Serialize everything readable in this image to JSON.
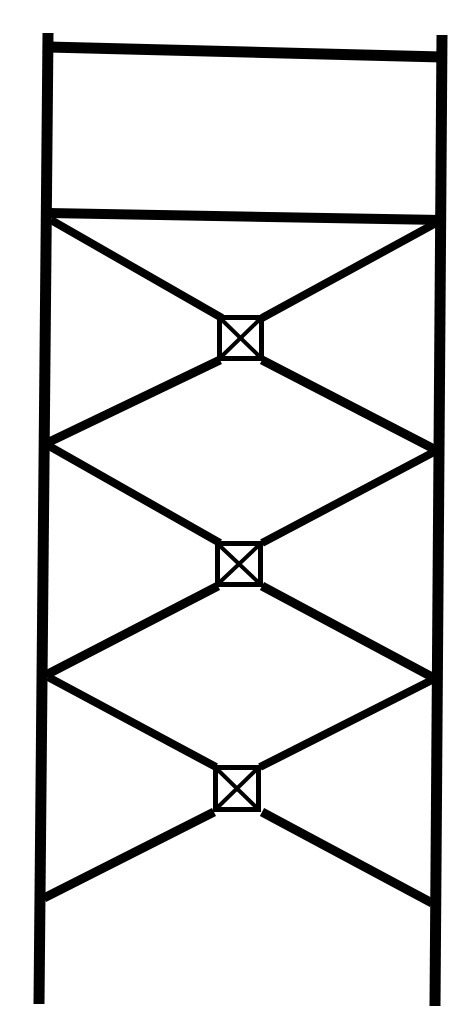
{
  "diagram": {
    "type": "scaffold-frame-elevation",
    "colors": {
      "background": "#ffffff",
      "stroke": "#000000"
    },
    "posts": [
      {
        "id": "left-post",
        "x1": 48,
        "y1": 33,
        "x2": 39,
        "y2": 1004,
        "width": 11
      },
      {
        "id": "right-post",
        "x1": 442,
        "y1": 35,
        "x2": 435,
        "y2": 1006,
        "width": 11
      }
    ],
    "rails": [
      {
        "id": "top-rail",
        "x1": 48,
        "y1": 47,
        "x2": 442,
        "y2": 57,
        "width": 11
      },
      {
        "id": "mid-rail",
        "x1": 48,
        "y1": 213,
        "x2": 442,
        "y2": 220,
        "width": 10
      }
    ],
    "braces": [
      {
        "id": "bay1-upper-left",
        "x1": 51,
        "y1": 220,
        "x2": 222,
        "y2": 318,
        "width": 8
      },
      {
        "id": "bay1-upper-right",
        "x1": 436,
        "y1": 223,
        "x2": 262,
        "y2": 318,
        "width": 8
      },
      {
        "id": "bay1-lower-left",
        "x1": 220,
        "y1": 360,
        "x2": 47,
        "y2": 443,
        "width": 9
      },
      {
        "id": "bay1-lower-right",
        "x1": 262,
        "y1": 360,
        "x2": 436,
        "y2": 450,
        "width": 9
      },
      {
        "id": "bay2-upper-left",
        "x1": 49,
        "y1": 446,
        "x2": 220,
        "y2": 543,
        "width": 8
      },
      {
        "id": "bay2-upper-right",
        "x1": 434,
        "y1": 452,
        "x2": 262,
        "y2": 543,
        "width": 8
      },
      {
        "id": "bay2-lower-left",
        "x1": 218,
        "y1": 586,
        "x2": 46,
        "y2": 675,
        "width": 9
      },
      {
        "id": "bay2-lower-right",
        "x1": 262,
        "y1": 586,
        "x2": 434,
        "y2": 678,
        "width": 9
      },
      {
        "id": "bay3-upper-left",
        "x1": 48,
        "y1": 677,
        "x2": 216,
        "y2": 767,
        "width": 8
      },
      {
        "id": "bay3-upper-right",
        "x1": 432,
        "y1": 680,
        "x2": 260,
        "y2": 767,
        "width": 8
      },
      {
        "id": "bay3-lower-left",
        "x1": 214,
        "y1": 812,
        "x2": 44,
        "y2": 898,
        "width": 9
      },
      {
        "id": "bay3-lower-right",
        "x1": 262,
        "y1": 812,
        "x2": 432,
        "y2": 903,
        "width": 9
      }
    ],
    "nodes": [
      {
        "id": "node-1",
        "x": 217,
        "y": 315,
        "w": 47,
        "h": 46,
        "stroke": 5
      },
      {
        "id": "node-2",
        "x": 215,
        "y": 541,
        "w": 48,
        "h": 46,
        "stroke": 5
      },
      {
        "id": "node-3",
        "x": 213,
        "y": 765,
        "w": 48,
        "h": 47,
        "stroke": 5
      }
    ]
  }
}
